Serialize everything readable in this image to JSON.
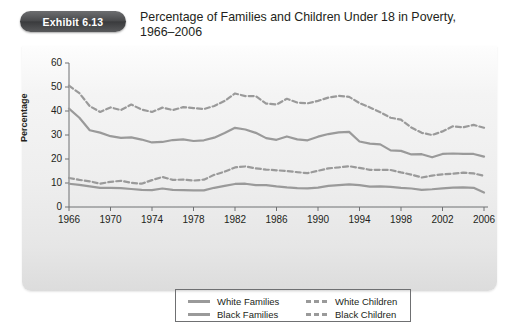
{
  "badge": {
    "label": "Exhibit 6.13"
  },
  "title": {
    "line1": "Percentage of Families and Children Under 18 in Poverty,",
    "line2": "1966–2006"
  },
  "colors": {
    "line": "#9a9a9a",
    "axis": "#6f7072",
    "text": "#231f20",
    "badge": "#4a4b4d",
    "panel": "#eeeeee"
  },
  "legend": {
    "items": [
      {
        "label": "White Families",
        "style": "solid"
      },
      {
        "label": "Black Families",
        "style": "solid"
      },
      {
        "label": "White Children",
        "style": "dashed"
      },
      {
        "label": "Black Children",
        "style": "dashed"
      }
    ]
  },
  "chart_data": {
    "type": "line",
    "title": "Percentage of Families and Children Under 18 in Poverty, 1966–2006",
    "xlabel": "",
    "ylabel": "Percentage",
    "xlim": [
      1966,
      2006
    ],
    "ylim": [
      0,
      60
    ],
    "yticks": [
      0,
      10,
      20,
      30,
      40,
      50,
      60
    ],
    "xticks": [
      1966,
      1970,
      1974,
      1978,
      1982,
      1986,
      1990,
      1994,
      1998,
      2002,
      2006
    ],
    "grid": false,
    "legend_position": "bottom",
    "x": [
      1966,
      1967,
      1968,
      1969,
      1970,
      1971,
      1972,
      1973,
      1974,
      1975,
      1976,
      1977,
      1978,
      1979,
      1980,
      1981,
      1982,
      1983,
      1984,
      1985,
      1986,
      1987,
      1988,
      1989,
      1990,
      1991,
      1992,
      1993,
      1994,
      1995,
      1996,
      1997,
      1998,
      1999,
      2000,
      2001,
      2002,
      2003,
      2004,
      2005,
      2006
    ],
    "series": [
      {
        "name": "White Families",
        "style": "solid",
        "values": [
          9.7,
          9.2,
          8.6,
          8.0,
          8.0,
          7.9,
          7.5,
          7.1,
          7.0,
          7.7,
          7.1,
          7.0,
          6.9,
          6.9,
          8.0,
          8.8,
          9.6,
          9.7,
          9.1,
          9.1,
          8.6,
          8.2,
          7.9,
          7.8,
          8.1,
          8.8,
          9.1,
          9.4,
          9.1,
          8.5,
          8.6,
          8.4,
          8.0,
          7.7,
          7.1,
          7.4,
          7.8,
          8.1,
          8.2,
          8.0,
          6.0
        ]
      },
      {
        "name": "Black Families",
        "style": "solid",
        "values": [
          41.0,
          37.2,
          32.0,
          31.0,
          29.5,
          28.8,
          29.0,
          28.1,
          26.9,
          27.1,
          27.9,
          28.2,
          27.5,
          27.8,
          28.9,
          30.8,
          33.0,
          32.3,
          30.9,
          28.7,
          28.0,
          29.4,
          28.2,
          27.8,
          29.3,
          30.4,
          31.1,
          31.3,
          27.3,
          26.4,
          26.1,
          23.6,
          23.4,
          21.9,
          22.0,
          20.7,
          22.1,
          22.3,
          22.1,
          22.1,
          21.0
        ]
      },
      {
        "name": "White Children",
        "style": "dashed",
        "values": [
          12.1,
          11.3,
          10.7,
          9.7,
          10.5,
          10.9,
          10.1,
          9.7,
          11.2,
          12.5,
          11.3,
          11.4,
          11.0,
          11.4,
          13.4,
          14.7,
          16.5,
          16.9,
          16.1,
          15.6,
          15.3,
          15.0,
          14.5,
          14.1,
          15.1,
          16.1,
          16.5,
          17.0,
          16.3,
          15.5,
          15.5,
          15.4,
          14.4,
          13.5,
          12.3,
          13.1,
          13.6,
          13.9,
          14.3,
          14.0,
          13.0
        ]
      },
      {
        "name": "Black Children",
        "style": "dashed",
        "values": [
          50.6,
          47.4,
          42.0,
          39.6,
          41.5,
          40.4,
          42.7,
          40.6,
          39.6,
          41.4,
          40.4,
          41.6,
          41.2,
          40.8,
          42.1,
          44.2,
          47.3,
          46.2,
          46.2,
          43.1,
          42.7,
          45.1,
          43.5,
          43.2,
          44.2,
          45.6,
          46.3,
          45.9,
          43.3,
          41.5,
          39.5,
          37.2,
          36.4,
          33.1,
          30.9,
          30.0,
          31.5,
          33.6,
          33.2,
          34.2,
          33.0
        ]
      }
    ]
  }
}
